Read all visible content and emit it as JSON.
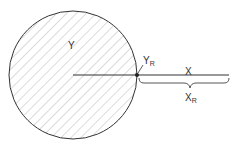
{
  "diagram": {
    "circle_label": "Y",
    "point_label": "Y",
    "point_label_sub": "R",
    "line_label": "X",
    "brace_label": "X",
    "brace_label_sub": "R",
    "colors": {
      "stroke": "#333333",
      "hatch": "#b8b8b8",
      "background": "#ffffff"
    }
  }
}
